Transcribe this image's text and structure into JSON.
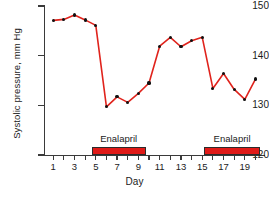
{
  "chart_data": {
    "type": "line",
    "title": "",
    "xlabel": "Day",
    "ylabel": "Systolic pressure, mm Hg",
    "xlim": [
      0.2,
      20.8
    ],
    "ylim": [
      120,
      150
    ],
    "grid": false,
    "legend": "none",
    "line_color": "#e0231c",
    "marker_color": "#111111",
    "x": [
      1,
      2,
      3,
      4,
      5,
      6,
      7,
      8,
      9,
      10,
      11,
      12,
      13,
      14,
      15,
      16,
      17,
      18,
      19,
      20
    ],
    "values": [
      147.1,
      147.3,
      148.2,
      147.2,
      146.1,
      129.7,
      131.7,
      130.6,
      132.4,
      134.5,
      141.9,
      143.7,
      141.8,
      143.0,
      143.7,
      133.4,
      136.4,
      133.2,
      131.2,
      135.3
    ],
    "y_ticks": [
      120,
      130,
      140,
      150
    ],
    "y_tick_labels": [
      "120",
      "130",
      "140",
      "150"
    ],
    "x_ticks": [
      1,
      2,
      3,
      4,
      5,
      6,
      7,
      8,
      9,
      10,
      11,
      12,
      13,
      14,
      15,
      16,
      17,
      18,
      19,
      20
    ],
    "x_tick_labels": [
      "1",
      "",
      "3",
      "",
      "5",
      "",
      "7",
      "",
      "9",
      "",
      "11",
      "",
      "13",
      "",
      "15",
      "",
      "17",
      "",
      "19",
      ""
    ],
    "annotations": [
      {
        "label": "Enalapril",
        "x_start": 4.6,
        "x_end": 9.7,
        "y_start": 120.0,
        "y_end": 121.6,
        "color": "#e01b18"
      },
      {
        "label": "Enalapril",
        "x_start": 15.2,
        "x_end": 20.4,
        "y_start": 120.0,
        "y_end": 121.6,
        "color": "#e01b18"
      }
    ]
  }
}
